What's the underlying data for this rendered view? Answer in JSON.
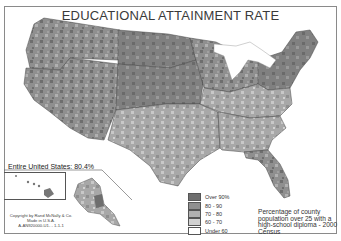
{
  "title": "EDUCATIONAL ATTAINMENT RATE",
  "national": {
    "label": "Entire United States:",
    "value": "80.4%"
  },
  "copyright": {
    "line1": "Copyright by Rand McNally & Co.",
    "line2": "Made in U.S.A.",
    "line3": "A-AN920000-U1- - 1-1-1"
  },
  "legend": {
    "items": [
      {
        "label": "Over 90%",
        "color": "#6e6e6e"
      },
      {
        "label": "80 - 90",
        "color": "#8f8f8f"
      },
      {
        "label": "70 - 80",
        "color": "#b0b0b0"
      },
      {
        "label": "60 - 70",
        "color": "#d2d2d2"
      },
      {
        "label": "Under 60",
        "color": "#ffffff"
      }
    ]
  },
  "note": "Percentage of county population over 25 with a high-school diploma - 2000 Census",
  "colors": {
    "over90": "#6e6e6e",
    "r80_90": "#8f8f8f",
    "r70_80": "#b0b0b0",
    "r60_70": "#d2d2d2",
    "under60": "#ffffff",
    "border": "#3c3c3c",
    "water": "#ffffff"
  }
}
